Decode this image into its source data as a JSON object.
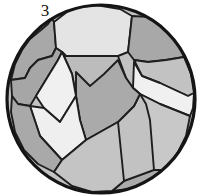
{
  "figure": {
    "label": "3",
    "caption_text": "3",
    "type": "micrograph-grain-structure",
    "shape": "circular-field-of-view",
    "background_color": "#ffffff"
  },
  "palette": {
    "outline": "#1a1a1a",
    "grain_dark": "#a8a8a8",
    "grain_medium": "#c2c2c2",
    "grain_light": "#d6d6d6",
    "grain_pale": "#ececec",
    "grain_white": "#f2f2f2",
    "circle_border": "#151515"
  },
  "circle": {
    "cx": 101,
    "cy": 99,
    "r": 94,
    "stroke_width": 3.2,
    "fill": "#c2c2c2"
  },
  "grains": [
    {
      "id": "grain-top-left-dark",
      "tone": "dark",
      "fill": "#a8a8a8",
      "points": "48,13 52,18 48,24 41,30 30,39 22,50 15,64 11,80 25,78 30,68 38,60 52,56 56,48 54,22"
    },
    {
      "id": "grain-top-center-light",
      "tone": "pale",
      "fill": "#e4e4e4",
      "points": "54,22 56,48 62,52 66,56 74,56 118,56 128,52 132,16 120,9 96,5 72,8"
    },
    {
      "id": "grain-top-right-dark",
      "tone": "dark",
      "fill": "#a8a8a8",
      "points": "132,16 128,52 134,60 148,62 166,60 184,57 178,40 166,26 150,17"
    },
    {
      "id": "grain-right-upper-medium",
      "tone": "medium",
      "fill": "#c2c2c2",
      "points": "134,60 148,62 166,60 184,57 191,74 194,93 188,96 160,83 142,76"
    },
    {
      "id": "grain-right-band-white",
      "tone": "white",
      "fill": "#f0f0f0",
      "points": "134,62 142,76 160,83 188,96 194,93 193,108 190,116 160,104 140,94 133,88"
    },
    {
      "id": "grain-right-lower-medium",
      "tone": "medium",
      "fill": "#c8c8c8",
      "points": "140,94 160,104 190,116 186,136 176,156 162,170 154,170 150,120 146,104"
    },
    {
      "id": "grain-bottom-right-dark",
      "tone": "dark",
      "fill": "#ababab",
      "points": "154,170 162,170 148,181 130,189 112,191 124,181"
    },
    {
      "id": "grain-center-medium",
      "tone": "medium",
      "fill": "#bcbcbc",
      "points": "74,56 66,56 62,52 72,74 76,96 80,120 86,140 118,122 134,106 140,94 133,88 126,78 118,56"
    },
    {
      "id": "grain-center-dark-wedge",
      "tone": "dark",
      "fill": "#aaaaaa",
      "points": "76,72 90,86 104,74 118,60 126,78 133,88 140,94 134,106 118,122 86,140 80,120 76,96"
    },
    {
      "id": "grain-left-mid-dark",
      "tone": "dark",
      "fill": "#a6a6a6",
      "points": "11,80 25,78 30,68 38,60 52,56 56,48 62,52 58,60 36,96 30,106 18,104 12,96"
    },
    {
      "id": "grain-left-band-upper-white",
      "tone": "white",
      "fill": "#f0f0f0",
      "points": "36,96 58,60 62,52 72,74 76,96 60,122 44,108"
    },
    {
      "id": "grain-left-band-lower-white",
      "tone": "white",
      "fill": "#efefef",
      "points": "30,106 44,108 60,122 76,96 80,120 86,140 62,160 40,136"
    },
    {
      "id": "grain-lower-left-dark",
      "tone": "dark",
      "fill": "#a9a9a9",
      "points": "12,96 18,104 30,106 40,136 62,160 54,172 38,164 24,150 15,132 11,112"
    },
    {
      "id": "grain-bottom-center-medium",
      "tone": "medium",
      "fill": "#c4c4c4",
      "points": "62,160 86,140 118,122 124,181 112,191 92,192 72,186 54,172"
    }
  ],
  "boundaries": [
    {
      "id": "b-circle-rim",
      "stroke": "#151515",
      "width": 3.2
    },
    {
      "id": "b-internal",
      "stroke": "#1e1e1e",
      "width": 1.9
    }
  ],
  "annotations": {
    "visible_text": [
      "3"
    ],
    "units": "",
    "scale_bar": ""
  }
}
